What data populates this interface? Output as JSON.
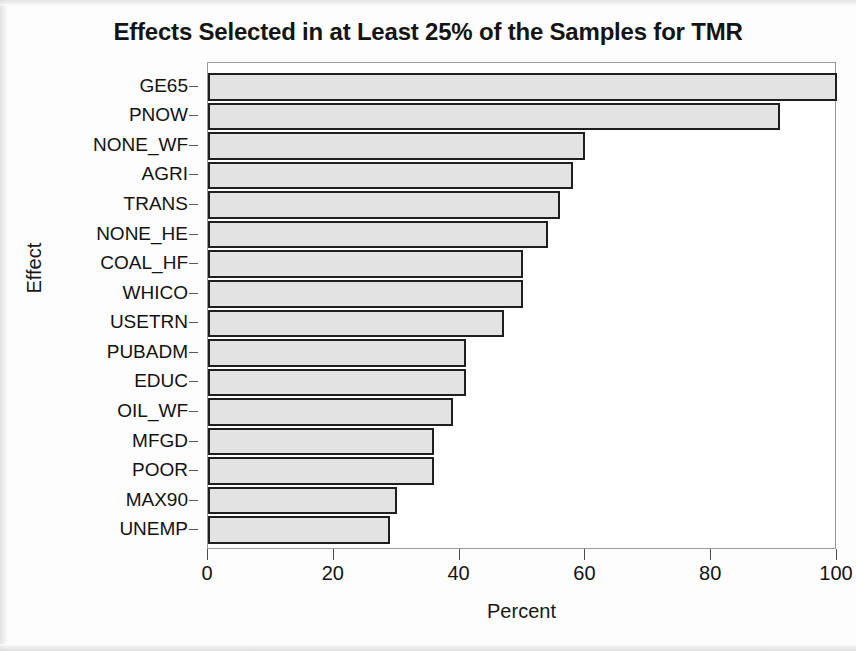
{
  "chart_data": {
    "type": "bar",
    "orientation": "horizontal",
    "title": "Effects Selected in at Least 25% of the Samples for TMR",
    "xlabel": "Percent",
    "ylabel": "Effect",
    "xlim": [
      0,
      100
    ],
    "xticks": [
      0,
      20,
      40,
      60,
      80,
      100
    ],
    "xtick_labels": [
      "0",
      "20",
      "40",
      "60",
      "80",
      "100"
    ],
    "grid": false,
    "legend": null,
    "bar_fill_color": "#e3e3e3",
    "bar_border_color": "#1f1f1f",
    "categories": [
      "GE65",
      "PNOW",
      "NONE_WF",
      "AGRI",
      "TRANS",
      "NONE_HE",
      "COAL_HF",
      "WHICO",
      "USETRN",
      "PUBADM",
      "EDUC",
      "OIL_WF",
      "MFGD",
      "POOR",
      "MAX90",
      "UNEMP"
    ],
    "values": [
      100,
      91,
      60,
      58,
      56,
      54,
      50,
      50,
      47,
      41,
      41,
      39,
      36,
      36,
      30,
      29
    ]
  }
}
